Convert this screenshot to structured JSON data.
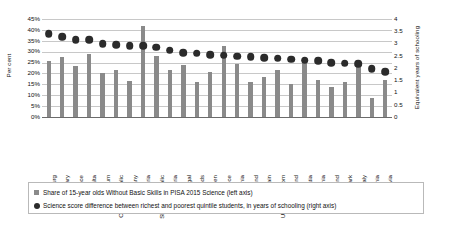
{
  "chart_data": {
    "type": "bar",
    "title": "",
    "subtitle": "",
    "xlabel": "",
    "ylabel": "Per cent",
    "y2label": "Equivalent years of schooling",
    "grid": true,
    "legend_position": "bottom",
    "ylim": [
      0,
      45
    ],
    "y2lim": [
      0,
      4
    ],
    "ytick_labels": [
      "45%",
      "40%",
      "35%",
      "30%",
      "25%",
      "20%",
      "15%",
      "10%",
      "5%",
      "0%"
    ],
    "ytick_values": [
      45,
      40,
      35,
      30,
      25,
      20,
      15,
      10,
      5,
      0
    ],
    "y2tick_labels": [
      "4",
      "3.5",
      "3",
      "2.5",
      "2",
      "1.5",
      "1",
      "0.5",
      "0"
    ],
    "y2tick_values": [
      4,
      3.5,
      3,
      2.5,
      2,
      1.5,
      1,
      0.5,
      0
    ],
    "categories": [
      "Luxembourg",
      "Hungary",
      "France",
      "Malta",
      "Belgium",
      "Czech Republic",
      "Germany",
      "Bulgaria",
      "Slovak Republic",
      "Austria",
      "Portugal",
      "Netherlands",
      "Sweden",
      "Greece",
      "Slovenia",
      "Poland",
      "Spain",
      "United Kingdom",
      "Ireland",
      "Croatia",
      "Lithuania",
      "Finland",
      "Denmark",
      "Italy",
      "Estonia",
      "Latvia"
    ],
    "series": [
      {
        "name": "Share of 15-year olds Without Basic Skills in PISA 2015 Science (left axis)",
        "type": "bar",
        "axis": "left",
        "unit": "%",
        "color": "#8a8a8a",
        "values": [
          25.5,
          27.5,
          23.5,
          29.0,
          20.0,
          21.8,
          16.7,
          42.0,
          27.8,
          21.7,
          23.8,
          16.2,
          20.5,
          32.7,
          24.5,
          16.3,
          18.3,
          21.5,
          15.3,
          24.6,
          17.2,
          13.6,
          15.9,
          23.2,
          8.8,
          17.2
        ]
      },
      {
        "name": "Science score difference between richest and poorest quintile students, in years of schooling (right axis)",
        "type": "scatter",
        "axis": "right",
        "unit": "years",
        "color": "#2b2b2b",
        "values": [
          3.4,
          3.28,
          3.15,
          3.15,
          2.98,
          2.95,
          2.9,
          2.9,
          2.85,
          2.72,
          2.62,
          2.6,
          2.55,
          2.52,
          2.48,
          2.45,
          2.42,
          2.4,
          2.35,
          2.32,
          2.3,
          2.22,
          2.2,
          2.18,
          1.98,
          1.85
        ]
      }
    ]
  },
  "legend": {
    "items": [
      {
        "marker": "square-swatch-icon",
        "label": "Share of 15-year olds Without Basic Skills in PISA 2015 Science (left axis)"
      },
      {
        "marker": "circle-swatch-icon",
        "label": "Science score difference between richest and poorest quintile students, in years of schooling (right axis)"
      }
    ]
  }
}
